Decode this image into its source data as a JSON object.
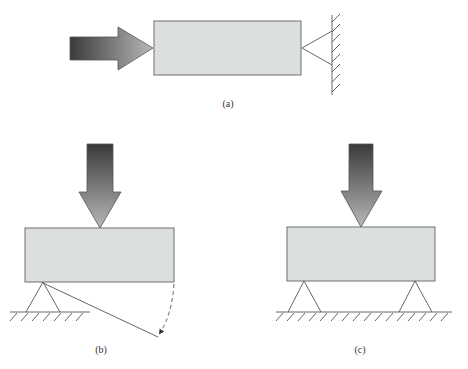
{
  "figure": {
    "panels": [
      {
        "id": "a",
        "label": "(a)",
        "description": "Horizontal block pushed from the left by a force arrow against a pin support attached to a vertical wall on the right"
      },
      {
        "id": "b",
        "label": "(b)",
        "description": "Block loaded from above by a downward force arrow, resting on a single pin support at its left corner; rotation path shown with dashed arc"
      },
      {
        "id": "c",
        "label": "(c)",
        "description": "Block loaded from above by a downward force arrow, supported by two pin supports on the ground"
      }
    ],
    "colors": {
      "block_fill": "#dcdfe0",
      "block_stroke": "#6e6e6e",
      "arrow_dark": "#3a3a3a",
      "arrow_light": "#b4b4b4",
      "line": "#555555"
    }
  }
}
